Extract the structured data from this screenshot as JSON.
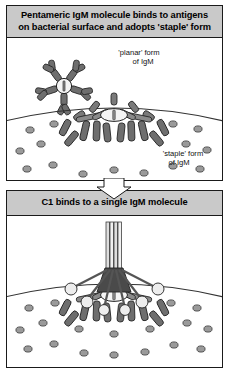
{
  "figure": {
    "colors": {
      "header_bar": "#c9c9c9",
      "panel_background": "#ffffff",
      "outline": "#1a1a1a",
      "igm_arm_dark": "#6e6e6e",
      "igm_arm_mid": "#8d8d8d",
      "igm_hub_light": "#f2f2f2",
      "antigen_fill": "#9a9a9a",
      "c1_head_light": "#ededed",
      "c1_stalk": "#dcdcdc",
      "c1_core_dark": "#4a4a4a"
    }
  },
  "panels": [
    {
      "id": "panel-pentameric-igm",
      "header": "Pentameric IgM molecule binds to antigens on bacterial surface and adopts 'staple' form",
      "header_lines": [
        "Pentameric IgM molecule binds to antigens",
        "on bacterial surface and adopts 'staple' form"
      ],
      "labels": [
        {
          "id": "planar-form-label",
          "lines": [
            "'planar' form",
            "of IgM"
          ]
        },
        {
          "id": "staple-form-label",
          "lines": [
            "'staple' form",
            "of IgM"
          ]
        }
      ],
      "elements": [
        {
          "id": "planar-igm",
          "description": "planar pentameric IgM star, 5 Y-shaped subunits"
        },
        {
          "id": "staple-igm",
          "description": "staple form IgM bound to bacterial surface"
        },
        {
          "id": "bacterial-surface",
          "description": "curved bacterial surface arc"
        },
        {
          "id": "antigens",
          "description": "antigen molecules on bacterial surface"
        }
      ]
    },
    {
      "id": "panel-c1-binding",
      "header": "C1 binds to a single IgM molecule",
      "header_lines": [
        "C1 binds to a single IgM molecule"
      ],
      "labels": [],
      "elements": [
        {
          "id": "c1-complex",
          "description": "C1 complex with collagenous stalks and globular heads"
        },
        {
          "id": "staple-igm",
          "description": "staple form IgM bound to bacterial surface"
        },
        {
          "id": "bacterial-surface",
          "description": "curved bacterial surface arc"
        },
        {
          "id": "antigens",
          "description": "antigen molecules on bacterial surface"
        }
      ]
    }
  ],
  "flow_arrow": {
    "id": "flow-arrow-down",
    "direction": "down"
  }
}
